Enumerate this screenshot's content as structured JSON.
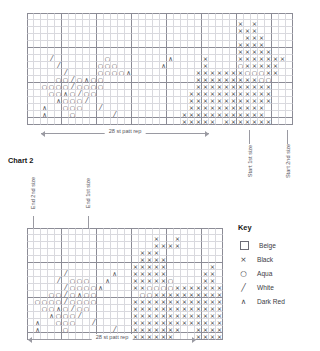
{
  "page": {
    "background": "#ffffff",
    "grid_line_color": "#d9d9de",
    "bold_line_color": "#8c8c96",
    "symbol_color": "#3b3b44"
  },
  "symbols": {
    "beige": "",
    "black": "×",
    "aqua": "○",
    "white": "╱",
    "darkred": "∧"
  },
  "key": {
    "title": "Key",
    "items": [
      {
        "symbol": "square",
        "glyph": "",
        "label": "Beige",
        "color": "#e8e2d5"
      },
      {
        "symbol": "cross",
        "glyph": "×",
        "label": "Black",
        "color": "#1a1a1a"
      },
      {
        "symbol": "circle",
        "glyph": "○",
        "label": "Aqua",
        "color": "#4fb3bf"
      },
      {
        "symbol": "slash",
        "glyph": "╱",
        "label": "White",
        "color": "#ffffff"
      },
      {
        "symbol": "caret",
        "glyph": "∧",
        "label": "Dark Red",
        "color": "#7a2230"
      }
    ]
  },
  "chart1": {
    "caption": "",
    "rep_label": "28 st patt rep",
    "cols": 38,
    "rows": 16,
    "markers": [
      {
        "name": "start-1st-size",
        "text": "Start 1st size",
        "col": 33
      },
      {
        "name": "start-2nd-size",
        "text": "Start 2nd size",
        "col": 38
      }
    ],
    "rep_start_col": 2,
    "rep_end_col": 30,
    "rowdata": [
      ".....................................",
      "..............................x.x.....",
      "..............................xxx.....",
      "...............................xxx....",
      "..............................xxxx....",
      "..............................xxxxx...",
      ".../.......o........^....x....xxxxxxx.",
      "..../.....ooo......^.....x....oxxxxx..",
      "...../....oooo^.........xxxxxxxoooxx..",
      "....oo/o^oo.............xxxxxxxxxoo...",
      "..oooo/oooo.............xxxxxxxxxxx...",
      "...oo^o/oo.............xxxxxxxxxxxx...",
      "....^ooo/..............xxxxxxxxxxxx...",
      "..^..ooo../............xxxxxxxxxxx....",
      "..^...o...../.........xxxxxxxxxxxx....",
      "......................xxxxx.xxxxxxx..."
    ]
  },
  "chart2": {
    "caption": "Chart 2",
    "rep_label": "28 st patt rep",
    "cols": 28,
    "rows": 16,
    "markers": [
      {
        "name": "end-2nd-size",
        "text": "End 2nd size",
        "col": 2
      },
      {
        "name": "end-1st-size",
        "text": "End 1st size",
        "col": 12
      }
    ],
    "rep_start_col": 0,
    "rep_end_col": 28,
    "rowdata": [
      "............................",
      "..................x..x......",
      "..................xxxx......",
      "................xxx.........",
      "................xxxx........",
      "...............xxxxx......x.",
      "...../......^..xxxxx.....xx.",
      "..../.ooo..^...xxxxxo....xx.",
      "...../oooo^....xxooooxxxxxxx",
      "...oo/o^oo......ooxxxxxxxxxx",
      ".oooo/oooo.....xxxxxxxxxxxxx",
      "..oo^o/oo......xxxxxxxxxxxxx",
      "...^ooo/.......xxxxxxxxxxxxx",
      ".^..ooo../.....xxxxxxxxxxxxx",
      ".^...o....../..xxxxxxx..xxxx",
      "..............xxxxxxx...xxxx"
    ]
  }
}
